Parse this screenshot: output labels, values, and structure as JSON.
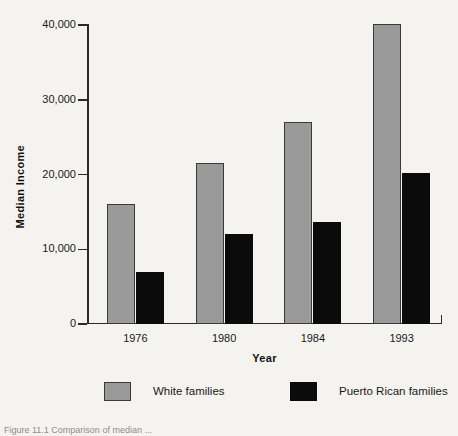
{
  "figure": {
    "background_color": "#f5f3ef",
    "caption": "Figure 11.1   Comparison of median ..."
  },
  "chart_data": {
    "type": "bar",
    "title": "",
    "xlabel": "Year",
    "ylabel": "Median Income",
    "categories": [
      "1976",
      "1980",
      "1984",
      "1993"
    ],
    "series": [
      {
        "name": "White families",
        "color": "#9a9a9a",
        "values": [
          16000,
          21500,
          27000,
          40200
        ]
      },
      {
        "name": "Puerto Rican families",
        "color": "#0b0b0b",
        "values": [
          7000,
          12000,
          13600,
          20200
        ]
      }
    ],
    "ylim": [
      0,
      40000
    ],
    "yticks": [
      0,
      10000,
      20000,
      30000,
      40000
    ],
    "ytick_labels": [
      "0",
      "10,000",
      "20,000",
      "30,000",
      "40,000"
    ],
    "grid": false,
    "legend_position": "bottom"
  }
}
